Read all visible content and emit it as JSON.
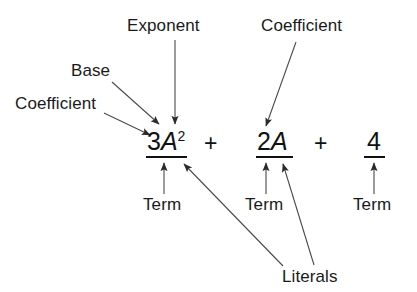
{
  "diagram": {
    "expression": {
      "terms": [
        {
          "coefficient": "3",
          "base": "A",
          "exponent": "2",
          "display": "3A2"
        },
        {
          "coefficient": "2",
          "base": "A",
          "exponent": "",
          "display": "2A"
        },
        {
          "coefficient": "4",
          "base": "",
          "exponent": "",
          "display": "4"
        }
      ],
      "operators": [
        "+",
        "+"
      ],
      "term1_coefficient": "3",
      "term1_base": "A",
      "term1_exponent": "2",
      "term2_coefficient": "2",
      "term2_base": "A",
      "term3_constant": "4",
      "operator1": "+",
      "operator2": "+"
    },
    "labels": {
      "coefficient_left": "Coefficient",
      "base": "Base",
      "exponent": "Exponent",
      "coefficient_right": "Coefficient",
      "term1": "Term",
      "term2": "Term",
      "term3": "Term",
      "literals": "Literals"
    },
    "colors": {
      "ink": "#1a1a1a",
      "expression_ink": "#111111",
      "arrow": "#4a4a4a",
      "background": "#ffffff"
    }
  }
}
